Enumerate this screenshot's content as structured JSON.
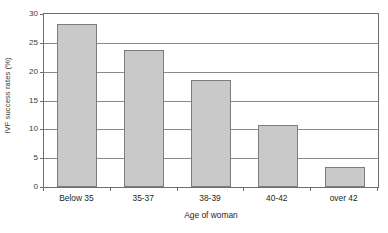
{
  "chart_data": {
    "type": "bar",
    "title": "",
    "xlabel": "Age of woman",
    "ylabel": "IVF success rates (%)",
    "categories": [
      "Below 35",
      "35-37",
      "38-39",
      "40-42",
      "over 42"
    ],
    "values": [
      28.3,
      23.8,
      18.5,
      10.8,
      3.4
    ],
    "ylim": [
      0,
      30
    ],
    "yticks": [
      0,
      5,
      10,
      15,
      20,
      25,
      30
    ],
    "ytick_labels": [
      "0",
      "5",
      "10",
      "15",
      "20",
      "25",
      "30"
    ],
    "grid": true,
    "grid_axis": "y",
    "legend": false,
    "bar_fill_color": "#c9c9c9",
    "bar_edge_color": "#7d7d7d",
    "axis_color": "#6d6d6d",
    "grid_color": "#8a8a8a",
    "text_color": "#231f20",
    "background_color": "#ffffff"
  }
}
